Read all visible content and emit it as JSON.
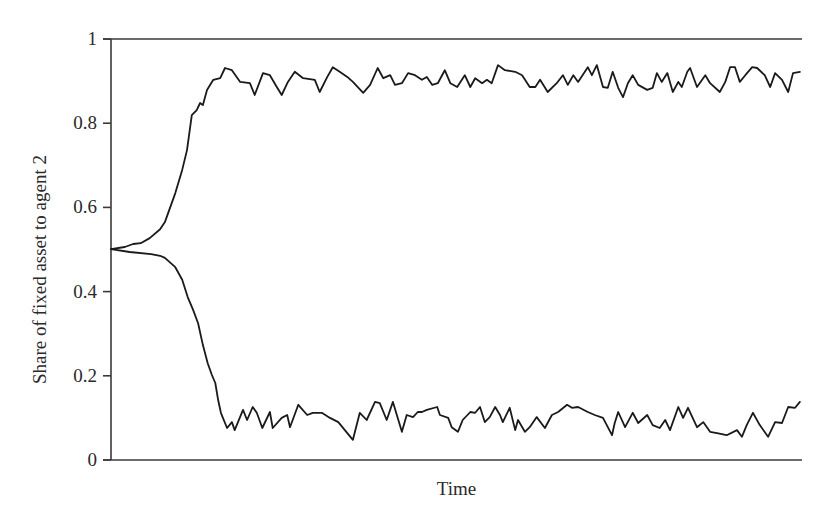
{
  "chart_data": {
    "type": "line",
    "title": "",
    "xlabel": "Time",
    "ylabel": "Share of fixed asset to agent 2",
    "xlim": [
      0,
      100
    ],
    "ylim": [
      0,
      1
    ],
    "yticks": [
      0,
      0.2,
      0.4,
      0.6,
      0.8,
      1
    ],
    "ytick_labels": [
      "0",
      "0.2",
      "0.4",
      "0.6",
      "0.8",
      "1"
    ],
    "xticks": [],
    "grid": false,
    "legend": null,
    "top_border": true,
    "line_color": "#1a1a1a",
    "series": [
      {
        "name": "upper path",
        "x": [
          0,
          2.0,
          3.2,
          4.3,
          5.6,
          7.1,
          7.8,
          9.3,
          10.3,
          11.0,
          11.7,
          12.4,
          12.9,
          13.3,
          13.9,
          14.8,
          15.8,
          16.5,
          17.5,
          18.7,
          20.1,
          20.8,
          22.0,
          23.0,
          24.0,
          24.7,
          25.6,
          26.6,
          27.8,
          29.5,
          30.2,
          31.3,
          32.1,
          33.1,
          34.2,
          35.0,
          36.5,
          37.5,
          38.6,
          39.4,
          40.4,
          41.1,
          42.1,
          43.0,
          44.0,
          45.0,
          45.7,
          46.5,
          47.3,
          48.3,
          49.1,
          50.1,
          51.2,
          52.0,
          52.7,
          53.7,
          54.4,
          55.1,
          56.0,
          57.0,
          58.5,
          59.5,
          60.6,
          61.4,
          62.1,
          63.2,
          64.5,
          65.4,
          66.1,
          66.9,
          67.6,
          69.0,
          69.6,
          70.3,
          71.2,
          71.9,
          72.6,
          73.4,
          74.1,
          74.8,
          75.5,
          76.3,
          77.6,
          78.4,
          79.0,
          79.7,
          80.5,
          81.3,
          82.1,
          82.6,
          83.4,
          83.8,
          84.8,
          86.0,
          86.7,
          88.1,
          88.9,
          89.6,
          90.3,
          91.0,
          91.8,
          92.8,
          93.5,
          94.6,
          95.4,
          96.1,
          97.1,
          98.0,
          98.7,
          99.7
        ],
        "y": [
          0.501,
          0.506,
          0.513,
          0.515,
          0.527,
          0.548,
          0.565,
          0.634,
          0.689,
          0.736,
          0.819,
          0.831,
          0.848,
          0.843,
          0.879,
          0.903,
          0.907,
          0.931,
          0.926,
          0.898,
          0.895,
          0.867,
          0.919,
          0.914,
          0.886,
          0.867,
          0.898,
          0.922,
          0.907,
          0.903,
          0.874,
          0.91,
          0.933,
          0.922,
          0.91,
          0.898,
          0.872,
          0.891,
          0.931,
          0.907,
          0.914,
          0.891,
          0.895,
          0.919,
          0.914,
          0.903,
          0.91,
          0.891,
          0.895,
          0.926,
          0.895,
          0.886,
          0.914,
          0.886,
          0.907,
          0.895,
          0.903,
          0.895,
          0.938,
          0.926,
          0.922,
          0.914,
          0.886,
          0.886,
          0.903,
          0.874,
          0.895,
          0.914,
          0.891,
          0.914,
          0.898,
          0.933,
          0.914,
          0.938,
          0.886,
          0.884,
          0.922,
          0.884,
          0.862,
          0.895,
          0.914,
          0.891,
          0.879,
          0.884,
          0.919,
          0.898,
          0.919,
          0.874,
          0.898,
          0.886,
          0.922,
          0.931,
          0.886,
          0.914,
          0.895,
          0.874,
          0.898,
          0.933,
          0.933,
          0.898,
          0.914,
          0.933,
          0.931,
          0.914,
          0.886,
          0.919,
          0.903,
          0.874,
          0.919,
          0.922
        ]
      },
      {
        "name": "lower path",
        "x": [
          0,
          2.7,
          5.8,
          7.1,
          7.8,
          9.3,
          10.3,
          11.1,
          11.9,
          12.6,
          13.3,
          14.0,
          14.6,
          15.1,
          15.5,
          15.9,
          16.2,
          16.8,
          17.5,
          17.9,
          19.1,
          19.7,
          20.5,
          21.1,
          21.9,
          23.0,
          23.4,
          24.7,
          25.5,
          25.9,
          27.1,
          28.4,
          29.2,
          30.5,
          31.7,
          32.9,
          34.2,
          35.0,
          36.0,
          37.0,
          38.2,
          38.9,
          39.9,
          40.8,
          42.1,
          42.8,
          43.7,
          44.4,
          45.0,
          45.7,
          47.2,
          47.6,
          48.8,
          49.3,
          50.2,
          50.9,
          52.0,
          52.7,
          53.4,
          54.1,
          54.8,
          55.6,
          56.3,
          56.7,
          57.7,
          58.5,
          58.9,
          59.9,
          60.6,
          61.6,
          62.8,
          63.8,
          64.7,
          66.0,
          66.7,
          67.6,
          69.0,
          70.0,
          71.2,
          72.5,
          72.9,
          73.4,
          74.4,
          75.5,
          76.3,
          77.6,
          78.4,
          79.4,
          80.2,
          80.9,
          82.1,
          82.8,
          83.5,
          84.8,
          85.7,
          86.7,
          87.7,
          89.1,
          90.6,
          91.3,
          92.0,
          92.9,
          93.9,
          95.1,
          96.1,
          97.1,
          98.0,
          99.0,
          99.7
        ],
        "y": [
          0.501,
          0.494,
          0.489,
          0.485,
          0.48,
          0.458,
          0.428,
          0.387,
          0.356,
          0.325,
          0.273,
          0.23,
          0.202,
          0.183,
          0.143,
          0.112,
          0.1,
          0.076,
          0.09,
          0.071,
          0.119,
          0.095,
          0.126,
          0.112,
          0.076,
          0.114,
          0.076,
          0.1,
          0.107,
          0.078,
          0.131,
          0.107,
          0.112,
          0.112,
          0.1,
          0.09,
          0.064,
          0.048,
          0.112,
          0.095,
          0.138,
          0.135,
          0.095,
          0.138,
          0.067,
          0.107,
          0.102,
          0.114,
          0.114,
          0.119,
          0.126,
          0.107,
          0.1,
          0.078,
          0.067,
          0.095,
          0.114,
          0.112,
          0.126,
          0.09,
          0.102,
          0.126,
          0.107,
          0.09,
          0.124,
          0.071,
          0.095,
          0.067,
          0.078,
          0.102,
          0.076,
          0.107,
          0.114,
          0.131,
          0.124,
          0.126,
          0.114,
          0.107,
          0.1,
          0.059,
          0.088,
          0.114,
          0.078,
          0.112,
          0.088,
          0.107,
          0.083,
          0.076,
          0.095,
          0.071,
          0.126,
          0.1,
          0.124,
          0.078,
          0.09,
          0.067,
          0.064,
          0.059,
          0.071,
          0.055,
          0.083,
          0.112,
          0.083,
          0.055,
          0.09,
          0.088,
          0.126,
          0.124,
          0.138
        ]
      }
    ]
  },
  "plot_area": {
    "left": 111,
    "right": 802,
    "top": 39,
    "bottom": 460
  }
}
